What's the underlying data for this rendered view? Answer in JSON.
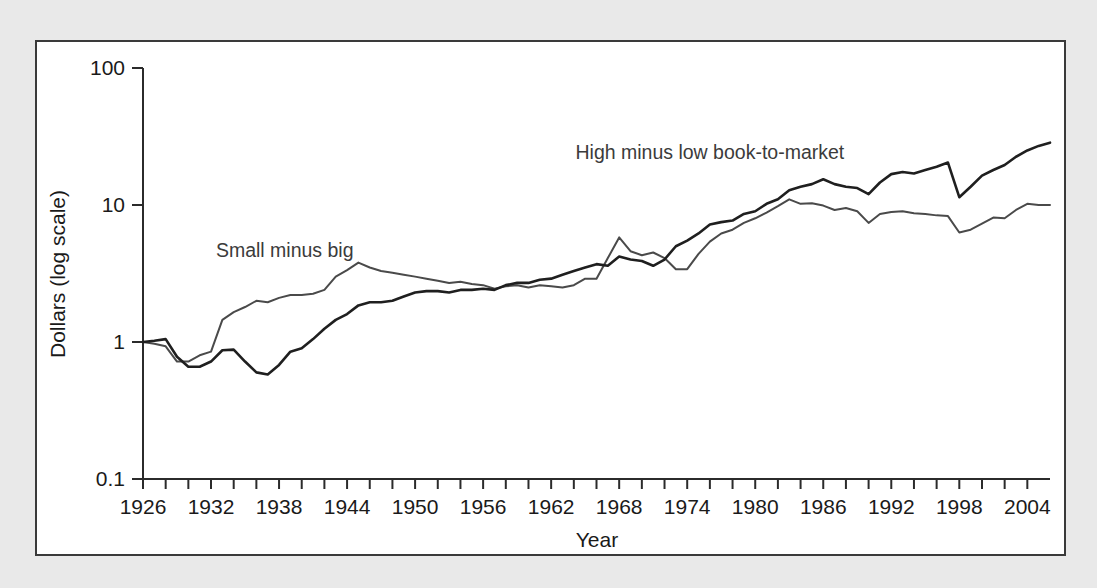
{
  "figure": {
    "background_color": "#e9e9e9",
    "panel_color": "#ffffff",
    "border_color": "#3a3a3a"
  },
  "chart_data": {
    "type": "line",
    "title": "",
    "xlabel": "Year",
    "ylabel": "Dollars (log scale)",
    "yscale": "log",
    "ylim": [
      0.1,
      100
    ],
    "xlim": [
      1926,
      2006
    ],
    "ytick_labels": [
      "100",
      "10",
      "1",
      "0.1"
    ],
    "ytick_values": [
      100,
      10,
      1,
      0.1
    ],
    "xtick_labels": [
      "1926",
      "1932",
      "1938",
      "1944",
      "1950",
      "1956",
      "1962",
      "1968",
      "1974",
      "1980",
      "1986",
      "1992",
      "1998",
      "2004"
    ],
    "xtick_values": [
      1926,
      1932,
      1938,
      1944,
      1950,
      1956,
      1962,
      1968,
      1974,
      1980,
      1986,
      1992,
      1998,
      2004
    ],
    "minor_tick_interval": 2,
    "grid": false,
    "legend_position": "inline-annotation",
    "annotations": [
      {
        "text": "Small minus big",
        "x": 1938.5,
        "y": 4.2,
        "series": "Small minus big"
      },
      {
        "text": "High minus low book-to-market",
        "x": 1976.0,
        "y": 21.5,
        "series": "High minus low book-to-market"
      }
    ],
    "series": [
      {
        "name": "Small minus big",
        "color": "#4a4a4a",
        "line_width": 2.0,
        "x": [
          1926,
          1927,
          1928,
          1929,
          1930,
          1931,
          1932,
          1933,
          1934,
          1935,
          1936,
          1937,
          1938,
          1939,
          1940,
          1941,
          1942,
          1943,
          1944,
          1945,
          1946,
          1947,
          1948,
          1949,
          1950,
          1951,
          1952,
          1953,
          1954,
          1955,
          1956,
          1957,
          1958,
          1959,
          1960,
          1961,
          1962,
          1963,
          1964,
          1965,
          1966,
          1967,
          1968,
          1969,
          1970,
          1971,
          1972,
          1973,
          1974,
          1975,
          1976,
          1977,
          1978,
          1979,
          1980,
          1981,
          1982,
          1983,
          1984,
          1985,
          1986,
          1987,
          1988,
          1989,
          1990,
          1991,
          1992,
          1993,
          1994,
          1995,
          1996,
          1997,
          1998,
          1999,
          2000,
          2001,
          2002,
          2003,
          2004,
          2005,
          2006
        ],
        "y": [
          1.0,
          0.97,
          0.93,
          0.72,
          0.72,
          0.8,
          0.85,
          1.45,
          1.65,
          1.8,
          2.0,
          1.95,
          2.1,
          2.2,
          2.2,
          2.25,
          2.4,
          3.0,
          3.35,
          3.8,
          3.5,
          3.3,
          3.2,
          3.1,
          3.0,
          2.9,
          2.8,
          2.7,
          2.75,
          2.65,
          2.6,
          2.45,
          2.55,
          2.6,
          2.5,
          2.6,
          2.55,
          2.5,
          2.6,
          2.9,
          2.9,
          4.1,
          5.8,
          4.6,
          4.3,
          4.5,
          4.1,
          3.4,
          3.4,
          4.4,
          5.4,
          6.2,
          6.6,
          7.4,
          8.0,
          8.8,
          9.8,
          11.0,
          10.2,
          10.3,
          9.9,
          9.2,
          9.5,
          9.0,
          7.4,
          8.6,
          8.9,
          9.0,
          8.7,
          8.6,
          8.4,
          8.3,
          6.3,
          6.6,
          7.3,
          8.1,
          8.0,
          9.2,
          10.2,
          10.0,
          10.0
        ]
      },
      {
        "name": "High minus low book-to-market",
        "color": "#1f1f1f",
        "line_width": 2.6,
        "x": [
          1926,
          1927,
          1928,
          1929,
          1930,
          1931,
          1932,
          1933,
          1934,
          1935,
          1936,
          1937,
          1938,
          1939,
          1940,
          1941,
          1942,
          1943,
          1944,
          1945,
          1946,
          1947,
          1948,
          1949,
          1950,
          1951,
          1952,
          1953,
          1954,
          1955,
          1956,
          1957,
          1958,
          1959,
          1960,
          1961,
          1962,
          1963,
          1964,
          1965,
          1966,
          1967,
          1968,
          1969,
          1970,
          1971,
          1972,
          1973,
          1974,
          1975,
          1976,
          1977,
          1978,
          1979,
          1980,
          1981,
          1982,
          1983,
          1984,
          1985,
          1986,
          1987,
          1988,
          1989,
          1990,
          1991,
          1992,
          1993,
          1994,
          1995,
          1996,
          1997,
          1998,
          1999,
          2000,
          2001,
          2002,
          2003,
          2004,
          2005,
          2006
        ],
        "y": [
          1.0,
          1.02,
          1.05,
          0.78,
          0.66,
          0.66,
          0.72,
          0.87,
          0.88,
          0.72,
          0.6,
          0.58,
          0.68,
          0.85,
          0.9,
          1.05,
          1.25,
          1.45,
          1.6,
          1.85,
          1.95,
          1.95,
          2.0,
          2.15,
          2.3,
          2.35,
          2.35,
          2.3,
          2.4,
          2.4,
          2.45,
          2.4,
          2.6,
          2.7,
          2.7,
          2.85,
          2.9,
          3.1,
          3.3,
          3.5,
          3.7,
          3.6,
          4.2,
          4.0,
          3.9,
          3.6,
          4.0,
          5.0,
          5.5,
          6.2,
          7.2,
          7.5,
          7.7,
          8.6,
          9.0,
          10.2,
          11.0,
          12.8,
          13.6,
          14.2,
          15.4,
          14.2,
          13.6,
          13.3,
          12.0,
          14.6,
          16.8,
          17.4,
          17.0,
          18.0,
          19.0,
          20.4,
          11.4,
          13.6,
          16.4,
          18.0,
          19.6,
          22.5,
          25.0,
          27.0,
          28.5
        ]
      }
    ]
  }
}
